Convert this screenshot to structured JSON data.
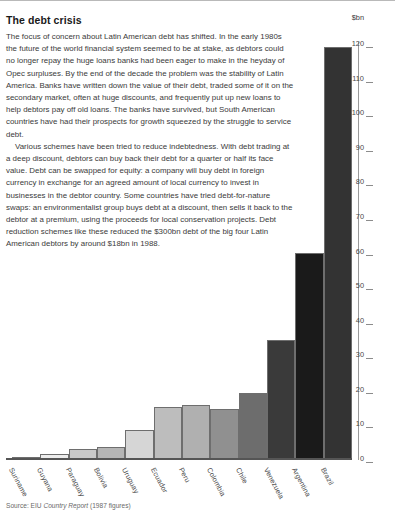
{
  "article": {
    "title": "The debt crisis",
    "paragraphs": [
      "The focus of concern about Latin American debt has shifted. In the early 1980s the future of the world financial system seemed to be at stake, as debtors could no longer repay the huge loans banks had been eager to make in the heyday of Opec surpluses. By the end of the decade the problem was the stability of Latin America. Banks have written down the value of their debt, traded some of it on the secondary market, often at huge discounts, and frequently put up new loans to help debtors pay off old loans. The banks have survived, but South American countries have had their prospects for growth squeezed by the struggle to service debt.",
      "Various schemes have been tried to reduce indebtedness. With debt trading at a deep discount, debtors can buy back their debt for a quarter or half its face value. Debt can be swapped for equity: a company will buy debt in foreign currency in exchange for an agreed amount of local currency to invest in businesses in the debtor country. Some countries have tried debt-for-nature swaps: an environmentalist group buys debt at a discount, then sells it back to the debtor at a premium, using the proceeds for local conservation projects. Debt reduction schemes like these reduced the $300bn debt of the big four Latin American debtors by around $18bn in 1988."
    ]
  },
  "source": {
    "label": "Source:",
    "org": "EIU",
    "publication": "Country Report",
    "note": "(1987 figures)"
  },
  "chart_data": {
    "type": "bar",
    "title": "",
    "xlabel": "",
    "ylabel": "$bn",
    "unit_label": "$bn",
    "ylim": [
      0,
      120
    ],
    "yticks": [
      120,
      110,
      100,
      90,
      80,
      70,
      60,
      50,
      40,
      30,
      20,
      10,
      0
    ],
    "grid": false,
    "legend": "none",
    "categories": [
      "Suriname",
      "Guyana",
      "Paraguay",
      "Bolivia",
      "Uruguay",
      "Ecuador",
      "Peru",
      "Colombia",
      "Chile",
      "Venezuela",
      "Argentina",
      "Brazil"
    ],
    "values": [
      0.5,
      1.5,
      3,
      3.5,
      8.5,
      15,
      15.5,
      14.5,
      19,
      34.5,
      59.5,
      119
    ],
    "bar_colors": [
      "#efefef",
      "#ededed",
      "#c9c9c9",
      "#b5b5b5",
      "#d6d6d6",
      "#bdbdbd",
      "#b0b0b0",
      "#909090",
      "#6d6d6d",
      "#3a3a3a",
      "#1a1a1a",
      "#333333"
    ]
  }
}
